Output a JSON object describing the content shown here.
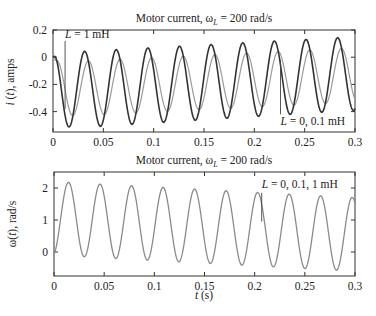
{
  "chart_data": [
    {
      "type": "line",
      "title": "Motor current, ωL = 200 rad/s",
      "title_parts": {
        "prefix": "Motor current, ω",
        "sub": "L",
        "suffix": " = 200 rad/s"
      },
      "xlabel": "",
      "ylabel": "i (t), amps",
      "xlim": [
        0,
        0.3
      ],
      "ylim": [
        -0.55,
        0.2
      ],
      "xticks": [
        "0",
        "0.05",
        "0.1",
        "0.15",
        "0.2",
        "0.25",
        "0.3"
      ],
      "xtick_values": [
        0,
        0.05,
        0.1,
        0.15,
        0.2,
        0.25,
        0.3
      ],
      "yticks": [
        "0.2",
        "0",
        "-0.2",
        "-0.4"
      ],
      "ytick_values": [
        0.2,
        0,
        -0.2,
        -0.4
      ],
      "grid": false,
      "series": [
        {
          "name": "L = 0, 0.1 mH",
          "color": "#333333",
          "omega": 200,
          "mean_start": -0.25,
          "mean_end": -0.12,
          "amp_start": 0.28,
          "amp_end": 0.27,
          "phase": 0
        },
        {
          "name": "L = 1 mH",
          "color": "#9a9a9a",
          "omega": 200,
          "mean_start": -0.24,
          "mean_end": -0.13,
          "amp_start": 0.2,
          "amp_end": 0.2,
          "phase": -0.75
        }
      ],
      "peaks_dark": [
        {
          "t": 0.031,
          "v": 0.02
        },
        {
          "t": 0.063,
          "v": 0.045
        },
        {
          "t": 0.094,
          "v": 0.06
        },
        {
          "t": 0.126,
          "v": 0.08
        },
        {
          "t": 0.157,
          "v": 0.1
        },
        {
          "t": 0.188,
          "v": 0.11
        },
        {
          "t": 0.22,
          "v": 0.13
        },
        {
          "t": 0.251,
          "v": 0.14
        },
        {
          "t": 0.283,
          "v": 0.16
        }
      ],
      "troughs_dark": [
        {
          "t": 0.016,
          "v": -0.53
        },
        {
          "t": 0.047,
          "v": -0.52
        },
        {
          "t": 0.078,
          "v": -0.5
        },
        {
          "t": 0.11,
          "v": -0.48
        },
        {
          "t": 0.141,
          "v": -0.46
        },
        {
          "t": 0.173,
          "v": -0.44
        },
        {
          "t": 0.204,
          "v": -0.43
        },
        {
          "t": 0.236,
          "v": -0.41
        },
        {
          "t": 0.267,
          "v": -0.4
        },
        {
          "t": 0.298,
          "v": -0.39
        }
      ],
      "annotations": [
        {
          "text": "L = 1 mH",
          "italic_part": "L",
          "rest": " = 1 mH",
          "x": 0.012,
          "y": 0.14,
          "line_from": [
            0.012,
            0.12
          ],
          "line_to": [
            0.012,
            -0.38
          ]
        },
        {
          "text": "L = 0, 0.1 mH",
          "italic_part": "L",
          "rest": " = 0, 0.1 mH",
          "x": 0.226,
          "y": -0.5,
          "line_from": [
            0.226,
            -0.02
          ],
          "line_to": [
            0.226,
            -0.42
          ]
        }
      ]
    },
    {
      "type": "line",
      "title": "Motor current, ωL = 200 rad/s",
      "title_parts": {
        "prefix": "Motor current, ω",
        "sub": "L",
        "suffix": " = 200 rad/s"
      },
      "xlabel": "t (s)",
      "xlabel_parts": {
        "italic": "t",
        "rest": " (s)"
      },
      "ylabel": "ω(t), rad/s",
      "xlim": [
        0,
        0.3
      ],
      "ylim": [
        -0.75,
        2.5
      ],
      "xticks": [
        "0",
        "0.05",
        "0.1",
        "0.15",
        "0.2",
        "0.25",
        "0.3"
      ],
      "xtick_values": [
        0,
        0.05,
        0.1,
        0.15,
        0.2,
        0.25,
        0.3
      ],
      "yticks": [
        "2",
        "1",
        "0"
      ],
      "ytick_values": [
        2,
        1,
        0
      ],
      "grid": false,
      "series": [
        {
          "name": "L = 0, 0.1, 1 mH",
          "color": "#8a8a8a",
          "omega": 200,
          "mean_start": 1.05,
          "mean_end": 0.55,
          "amp_start": 1.15,
          "amp_end": 1.15
        }
      ],
      "peaks": [
        {
          "t": 0.016,
          "v": 2.2
        },
        {
          "t": 0.047,
          "v": 2.1
        },
        {
          "t": 0.078,
          "v": 2.05
        },
        {
          "t": 0.11,
          "v": 1.97
        },
        {
          "t": 0.141,
          "v": 1.9
        },
        {
          "t": 0.173,
          "v": 1.83
        },
        {
          "t": 0.204,
          "v": 1.77
        },
        {
          "t": 0.236,
          "v": 1.72
        },
        {
          "t": 0.267,
          "v": 1.68
        },
        {
          "t": 0.298,
          "v": 1.65
        }
      ],
      "troughs": [
        {
          "t": 0.031,
          "v": -0.1
        },
        {
          "t": 0.063,
          "v": -0.18
        },
        {
          "t": 0.094,
          "v": -0.24
        },
        {
          "t": 0.126,
          "v": -0.31
        },
        {
          "t": 0.157,
          "v": -0.38
        },
        {
          "t": 0.188,
          "v": -0.43
        },
        {
          "t": 0.22,
          "v": -0.48
        },
        {
          "t": 0.251,
          "v": -0.53
        },
        {
          "t": 0.283,
          "v": -0.58
        }
      ],
      "annotations": [
        {
          "text": "L = 0, 0.1, 1 mH",
          "italic_part": "L",
          "rest": " = 0, 0.1, 1 mH",
          "x": 0.207,
          "y": 2.0,
          "line_from": [
            0.207,
            1.85
          ],
          "line_to": [
            0.207,
            0.95
          ]
        }
      ]
    }
  ]
}
